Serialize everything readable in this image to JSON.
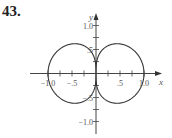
{
  "problem_number": "43.",
  "chart_data": {
    "type": "line",
    "subtype": "polar-curve",
    "title": "",
    "xlabel": "x",
    "ylabel": "y",
    "xlim": [
      -1.25,
      1.25
    ],
    "ylim": [
      -1.25,
      1.25
    ],
    "grid": false,
    "legend": null,
    "x_ticks": [
      -1.0,
      -0.75,
      -0.5,
      -0.25,
      0.25,
      0.5,
      0.75,
      1.0
    ],
    "y_ticks": [
      -1.0,
      -0.75,
      -0.5,
      -0.25,
      0.25,
      0.5,
      0.75,
      1.0
    ],
    "x_tick_labels": [
      {
        "value": -1.0,
        "label": "−1.0"
      },
      {
        "value": -0.5,
        "label": "−.5"
      },
      {
        "value": 0.5,
        "label": ".5"
      },
      {
        "value": 1.0,
        "label": "1.0"
      }
    ],
    "y_tick_labels": [
      {
        "value": 1.0,
        "label": "1.0"
      },
      {
        "value": 0.5,
        "label": ".5"
      },
      {
        "value": -0.5,
        "label": "−.5"
      },
      {
        "value": -1.0,
        "label": "−1.0"
      }
    ],
    "key_points": [
      {
        "x": 1.0,
        "y": 0.0
      },
      {
        "x": -1.0,
        "y": 0.0
      },
      {
        "x": 0.44,
        "y": 0.62
      },
      {
        "x": 0.44,
        "y": -0.62
      },
      {
        "x": -0.44,
        "y": 0.62
      },
      {
        "x": -0.44,
        "y": -0.62
      },
      {
        "x": 0.0,
        "y": 0.0
      }
    ],
    "curve_color": "#333333"
  },
  "layout": {
    "origin_px": [
      96,
      73.5
    ],
    "unit_px": 48,
    "x_axis_px": [
      30,
      162
    ],
    "y_axis_px": [
      134,
      13
    ]
  }
}
